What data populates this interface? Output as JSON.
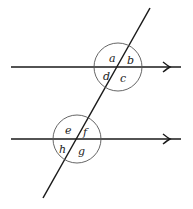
{
  "diagram": {
    "type": "parallel-lines-transversal",
    "colors": {
      "line": "#1a1a1a",
      "circle": "#555555",
      "label": "#222222",
      "background": "#ffffff"
    },
    "parallel_lines": [
      {
        "id": "top-line",
        "y": 67,
        "x1": 11,
        "x2": 181,
        "arrow_x": 168
      },
      {
        "id": "bottom-line",
        "y": 139,
        "x1": 11,
        "x2": 181,
        "arrow_x": 168
      }
    ],
    "transversal": {
      "x1": 150,
      "y1": 8,
      "x2": 43,
      "y2": 198
    },
    "circles": [
      {
        "id": "top-intersection-circle",
        "cx": 118,
        "cy": 67,
        "r": 24
      },
      {
        "id": "bottom-intersection-circle",
        "cx": 77,
        "cy": 139,
        "r": 24
      }
    ],
    "angle_labels": {
      "a": "a",
      "b": "b",
      "c": "c",
      "d": "d",
      "e": "e",
      "f": "f",
      "g": "g",
      "h": "h"
    }
  }
}
